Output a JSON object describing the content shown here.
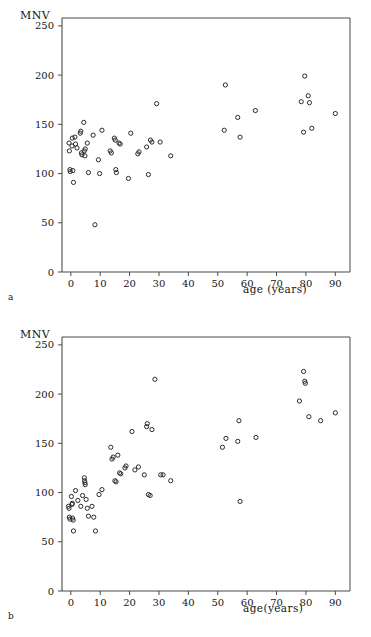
{
  "figure": {
    "panels": [
      {
        "letter": "a",
        "ylabel": "MNV",
        "xlabel": "age (years)",
        "chart_index": 0
      },
      {
        "letter": "b",
        "ylabel": "MNV",
        "xlabel": "age(years)",
        "chart_index": 1
      }
    ]
  },
  "chart_data": [
    {
      "type": "scatter",
      "panel": "a",
      "title": "",
      "xlabel": "age (years)",
      "ylabel": "MNV",
      "xlim": [
        -3,
        95
      ],
      "ylim": [
        0,
        258
      ],
      "xticks": [
        0,
        10,
        20,
        30,
        40,
        50,
        60,
        70,
        80,
        90
      ],
      "yticks": [
        0,
        50,
        100,
        150,
        200,
        250
      ],
      "xticklabels": [
        "0",
        "10",
        "20",
        "30",
        "40",
        "50",
        "60",
        "70",
        "80",
        "90"
      ],
      "yticklabels": [
        "0",
        "50",
        "100",
        "150",
        "200",
        "250"
      ],
      "grid": false,
      "legend": false,
      "marker": "open-circle",
      "points": [
        [
          -0.6,
          131
        ],
        [
          -0.5,
          123
        ],
        [
          -0.3,
          104
        ],
        [
          -0.2,
          102
        ],
        [
          0.4,
          128
        ],
        [
          0.5,
          136
        ],
        [
          0.7,
          103
        ],
        [
          0.9,
          91
        ],
        [
          1.4,
          137
        ],
        [
          1.6,
          130
        ],
        [
          2.1,
          126
        ],
        [
          3.2,
          141
        ],
        [
          3.4,
          143
        ],
        [
          3.6,
          121
        ],
        [
          3.8,
          119
        ],
        [
          4.4,
          152
        ],
        [
          4.6,
          123
        ],
        [
          4.8,
          118
        ],
        [
          4.9,
          125
        ],
        [
          5.6,
          131
        ],
        [
          6.0,
          101
        ],
        [
          7.6,
          139
        ],
        [
          8.2,
          48
        ],
        [
          9.4,
          114
        ],
        [
          9.8,
          100
        ],
        [
          10.6,
          144
        ],
        [
          13.4,
          123
        ],
        [
          13.8,
          121
        ],
        [
          14.8,
          136
        ],
        [
          15.1,
          134
        ],
        [
          15.3,
          104
        ],
        [
          15.5,
          101
        ],
        [
          16.4,
          131
        ],
        [
          16.8,
          130
        ],
        [
          19.6,
          95
        ],
        [
          20.4,
          141
        ],
        [
          22.8,
          120
        ],
        [
          23.2,
          122
        ],
        [
          25.8,
          127
        ],
        [
          26.4,
          99
        ],
        [
          27.1,
          134
        ],
        [
          27.6,
          132
        ],
        [
          29.2,
          171
        ],
        [
          30.4,
          132
        ],
        [
          34.0,
          118
        ],
        [
          52.2,
          144
        ],
        [
          52.6,
          190
        ],
        [
          56.8,
          157
        ],
        [
          57.6,
          137
        ],
        [
          62.8,
          164
        ],
        [
          78.4,
          173
        ],
        [
          79.2,
          142
        ],
        [
          79.6,
          199
        ],
        [
          80.8,
          179
        ],
        [
          81.2,
          172
        ],
        [
          82.0,
          146
        ],
        [
          90.0,
          161
        ]
      ]
    },
    {
      "type": "scatter",
      "panel": "b",
      "title": "",
      "xlabel": "age(years)",
      "ylabel": "MNV",
      "xlim": [
        -3,
        95
      ],
      "ylim": [
        0,
        258
      ],
      "xticks": [
        0,
        10,
        20,
        30,
        40,
        50,
        60,
        70,
        80,
        90
      ],
      "yticks": [
        0,
        50,
        100,
        150,
        200,
        250
      ],
      "xticklabels": [
        "0",
        "10",
        "20",
        "30",
        "40",
        "50",
        "60",
        "70",
        "80",
        "90"
      ],
      "yticklabels": [
        "0",
        "50",
        "100",
        "150",
        "200",
        "250"
      ],
      "grid": false,
      "legend": false,
      "marker": "open-circle",
      "points": [
        [
          -0.8,
          86
        ],
        [
          -0.6,
          84
        ],
        [
          -0.5,
          75
        ],
        [
          -0.3,
          73
        ],
        [
          0.2,
          96
        ],
        [
          0.4,
          88
        ],
        [
          0.5,
          89
        ],
        [
          0.6,
          74
        ],
        [
          0.8,
          72
        ],
        [
          0.9,
          61
        ],
        [
          1.6,
          102
        ],
        [
          2.4,
          92
        ],
        [
          3.4,
          86
        ],
        [
          4.0,
          97
        ],
        [
          4.6,
          115
        ],
        [
          4.7,
          112
        ],
        [
          4.8,
          110
        ],
        [
          4.9,
          108
        ],
        [
          5.2,
          93
        ],
        [
          5.6,
          84
        ],
        [
          6.0,
          76
        ],
        [
          7.2,
          86
        ],
        [
          7.8,
          75
        ],
        [
          8.4,
          61
        ],
        [
          9.6,
          98
        ],
        [
          10.6,
          103
        ],
        [
          13.6,
          146
        ],
        [
          14.0,
          134
        ],
        [
          14.4,
          136
        ],
        [
          15.0,
          112
        ],
        [
          15.4,
          111
        ],
        [
          16.0,
          138
        ],
        [
          16.6,
          120
        ],
        [
          17.0,
          119
        ],
        [
          18.4,
          125
        ],
        [
          18.8,
          127
        ],
        [
          20.8,
          162
        ],
        [
          21.8,
          123
        ],
        [
          23.0,
          126
        ],
        [
          25.0,
          118
        ],
        [
          25.8,
          167
        ],
        [
          26.0,
          170
        ],
        [
          26.4,
          98
        ],
        [
          27.0,
          97
        ],
        [
          27.6,
          164
        ],
        [
          28.6,
          215
        ],
        [
          30.6,
          118
        ],
        [
          31.4,
          118
        ],
        [
          34.0,
          112
        ],
        [
          51.6,
          146
        ],
        [
          52.8,
          155
        ],
        [
          56.8,
          152
        ],
        [
          57.2,
          173
        ],
        [
          57.6,
          91
        ],
        [
          63.0,
          156
        ],
        [
          77.8,
          193
        ],
        [
          79.2,
          223
        ],
        [
          79.6,
          213
        ],
        [
          79.8,
          211
        ],
        [
          81.0,
          177
        ],
        [
          85.0,
          173
        ],
        [
          90.0,
          181
        ]
      ]
    }
  ]
}
